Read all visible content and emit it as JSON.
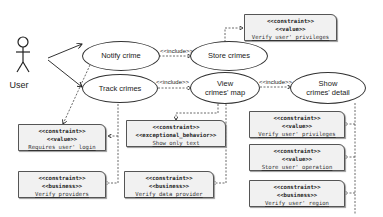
{
  "actor": {
    "label": "User"
  },
  "use_cases": [
    {
      "id": "notify",
      "label": "Notify crime"
    },
    {
      "id": "track",
      "label": "Track crimes"
    },
    {
      "id": "store",
      "label": "Store crimes"
    },
    {
      "id": "view",
      "label": "View\ncrimes' map"
    },
    {
      "id": "show",
      "label": "Show\ncrimes' detail"
    }
  ],
  "relations": {
    "include_label": "<<include>>"
  },
  "notes": [
    {
      "id": "n_store_priv",
      "stereo1": "<<constraint>>",
      "stereo2": "<<value>>",
      "text": "Verify user' privileges"
    },
    {
      "id": "n_login",
      "stereo1": "<<constraint>>",
      "stereo2": "<<value>>",
      "text": "Requires user' login"
    },
    {
      "id": "n_text",
      "stereo1": "<<constraint>>",
      "stereo2": "<<exceptional_behavior>>",
      "text": "Show only text"
    },
    {
      "id": "n_providers",
      "stereo1": "<<constraint>>",
      "stereo2": "<<business>>",
      "text": "Verify providers"
    },
    {
      "id": "n_dataprov",
      "stereo1": "<<constraint>>",
      "stereo2": "<<business>>",
      "text": "Verify data provider"
    },
    {
      "id": "n_show_priv",
      "stereo1": "<<constraint>>",
      "stereo2": "<<value>>",
      "text": "Verify user' privileges"
    },
    {
      "id": "n_store_op",
      "stereo1": "<<constraint>>",
      "stereo2": "<<value>>",
      "text": "Store user' operation"
    },
    {
      "id": "n_region",
      "stereo1": "<<constraint>>",
      "stereo2": "<<business>>",
      "text": "Verify user' region"
    }
  ]
}
